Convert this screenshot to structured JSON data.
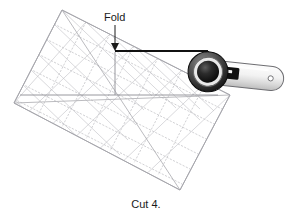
{
  "figure": {
    "name": "quilting-cut-diagram",
    "caption": "Cut 4.",
    "annotations": {
      "fold_label": "Fold"
    },
    "colors": {
      "background": "#ffffff",
      "text": "#1a1a1a",
      "ruler_line": "#b9b9bd",
      "ruler_line_dark": "#9a9aa0",
      "ruler_fill": "#ffffff",
      "cut_line": "#111111",
      "guide_line": "#8d8d93",
      "cutter_blade_dark": "#111111",
      "cutter_blade_ring": "#3a3a3a",
      "cutter_handle_fill": "#efefef",
      "cutter_handle_stroke": "#6e6e72",
      "cutter_handle_highlight": "#fdfdfd"
    },
    "objects": [
      {
        "name": "quilting-ruler",
        "label": "Rotated square quilting ruler with measuring grid"
      },
      {
        "name": "rotary-cutter",
        "label": "Rotary cutter with circular blade and handle"
      },
      {
        "name": "fold-arrow",
        "label": "Arrow pointing down to fold edge"
      },
      {
        "name": "cut-line",
        "label": "Dark horizontal cutting line along ruler edge"
      }
    ],
    "ruler": {
      "grid_columns": 7,
      "grid_rows": 6,
      "rotation_degrees": -32,
      "has_diagonal_lines": true
    }
  }
}
